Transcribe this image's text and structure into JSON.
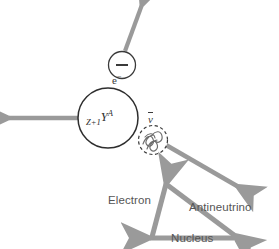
{
  "diagram": {
    "background_color": "#ffffff",
    "arrow_color": "#9a9a9a",
    "outline_color": "#333333",
    "label_color": "#555555",
    "symbol_color": "#3b3b3b",
    "particles": {
      "electron": {
        "symbol_base": "e",
        "symbol_charge": "−",
        "circle_sign": "−",
        "name": "Electron"
      },
      "nucleus": {
        "symbol_subscript": "Z+1",
        "symbol_element": "Y",
        "symbol_superscript": "A",
        "name": "Nucleus"
      },
      "antineutrino": {
        "symbol": "ν",
        "name": "Antineutrino"
      }
    },
    "vector_triangle": {
      "labels": {
        "electron": "Electron",
        "antineutrino": "Antineutrino",
        "nucleus": "Nucleus"
      }
    }
  }
}
